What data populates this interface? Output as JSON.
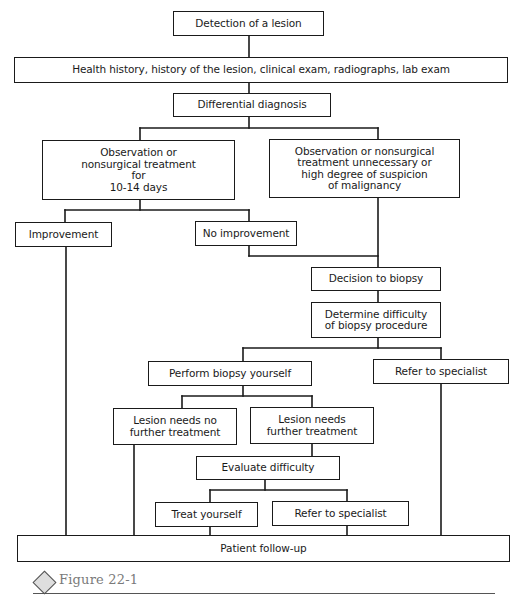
{
  "flowchart": {
    "nodes": {
      "detection": "Detection of a lesion",
      "history": "Health history, history of the lesion, clinical exam, radiographs, lab exam",
      "differential": "Differential diagnosis",
      "observation": "Observation or\nnonsurgical treatment\nfor\n10-14 days",
      "observation_unnecessary": "Observation or nonsurgical\ntreatment unnecessary or\nhigh degree of suspicion\nof malignancy",
      "improvement": "Improvement",
      "no_improvement": "No improvement",
      "decision_biopsy": "Decision to biopsy",
      "determine_difficulty": "Determine difficulty\nof biopsy procedure",
      "perform_biopsy": "Perform biopsy yourself",
      "refer_specialist_1": "Refer to specialist",
      "lesion_no_treatment": "Lesion needs no\nfurther treatment",
      "lesion_needs_treatment": "Lesion needs\nfurther treatment",
      "evaluate_difficulty": "Evaluate difficulty",
      "treat_yourself": "Treat yourself",
      "refer_specialist_2": "Refer to specialist",
      "patient_followup": "Patient follow-up"
    },
    "edges": [
      [
        "detection",
        "history"
      ],
      [
        "history",
        "differential"
      ],
      [
        "differential",
        "observation"
      ],
      [
        "differential",
        "observation_unnecessary"
      ],
      [
        "observation",
        "improvement"
      ],
      [
        "observation",
        "no_improvement"
      ],
      [
        "no_improvement",
        "decision_biopsy"
      ],
      [
        "observation_unnecessary",
        "decision_biopsy"
      ],
      [
        "decision_biopsy",
        "determine_difficulty"
      ],
      [
        "determine_difficulty",
        "perform_biopsy"
      ],
      [
        "determine_difficulty",
        "refer_specialist_1"
      ],
      [
        "perform_biopsy",
        "lesion_no_treatment"
      ],
      [
        "perform_biopsy",
        "lesion_needs_treatment"
      ],
      [
        "lesion_needs_treatment",
        "evaluate_difficulty"
      ],
      [
        "evaluate_difficulty",
        "treat_yourself"
      ],
      [
        "evaluate_difficulty",
        "refer_specialist_2"
      ],
      [
        "improvement",
        "patient_followup"
      ],
      [
        "lesion_no_treatment",
        "patient_followup"
      ],
      [
        "treat_yourself",
        "patient_followup"
      ],
      [
        "refer_specialist_2",
        "patient_followup"
      ],
      [
        "refer_specialist_1",
        "patient_followup"
      ]
    ]
  },
  "caption": {
    "icon": "diamond-icon",
    "label": "Figure 22-1"
  }
}
